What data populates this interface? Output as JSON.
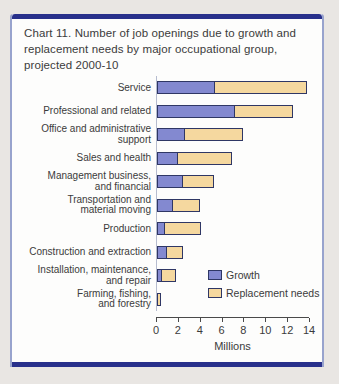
{
  "page": {
    "background_color": "#e9e6e3",
    "card_background": "#fdfdfc",
    "card_border_color": "#98a3cd",
    "accent_bar_color": "#28308b"
  },
  "title": "Chart 11. Number of job openings due to growth and replacement needs by major occupational group, projected 2000-10",
  "chart_data": {
    "type": "bar",
    "orientation": "horizontal",
    "stacked": true,
    "title": "Chart 11. Number of job openings due to growth and replacement needs by major occupational group, projected 2000-10",
    "categories": [
      "Service",
      "Professional and related",
      "Office and administrative\nsupport",
      "Sales and health",
      "Management business,\nand financial",
      "Transportation and\nmaterial moving",
      "Production",
      "Construction and extraction",
      "Installation, maintenance,\nand repair",
      "Farming, fishing,\nand forestry"
    ],
    "series": [
      {
        "name": "Growth",
        "color": "#8389d0",
        "values": [
          5.3,
          7.1,
          2.6,
          1.9,
          2.4,
          1.5,
          0.7,
          0.9,
          0.5,
          0.0
        ]
      },
      {
        "name": "Replacement needs",
        "color": "#f5d89f",
        "values": [
          8.4,
          5.3,
          5.3,
          4.9,
          2.8,
          2.5,
          3.3,
          1.5,
          1.3,
          0.4
        ]
      }
    ],
    "xlabel": "Millions",
    "xticks": [
      0,
      2,
      4,
      6,
      8,
      10,
      12,
      14
    ],
    "xlim": [
      0,
      15.3
    ],
    "grid": false,
    "legend_position": "lower-right",
    "units": "millions of job openings"
  }
}
